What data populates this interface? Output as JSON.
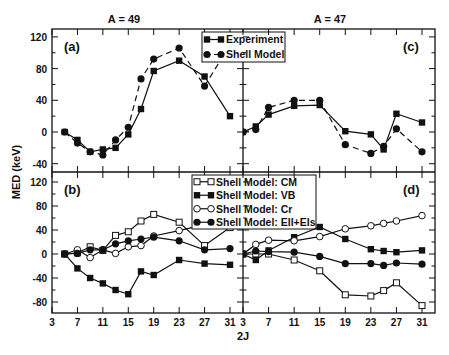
{
  "chart_data": {
    "type": "line",
    "ylabel": "MED (keV)",
    "xlabel": "2J",
    "x_ticks": [
      3,
      7,
      11,
      15,
      19,
      23,
      27,
      31
    ],
    "column_titles": [
      "A = 49",
      "A = 47"
    ],
    "panels": [
      {
        "id": "a",
        "label": "(a)",
        "column": 0,
        "row": 0,
        "ylim": [
          -48,
          130
        ],
        "y_ticks": [
          -40,
          0,
          40,
          80,
          120
        ],
        "legend": {
          "entries": [
            "Experiment",
            "Shell Model"
          ]
        },
        "series": [
          {
            "name": "Experiment",
            "marker": "square-filled",
            "dash": false,
            "x": [
              5,
              7,
              9,
              11,
              13,
              15,
              17,
              19,
              23,
              27,
              31
            ],
            "y": [
              0,
              -10,
              -25,
              -22,
              -20,
              -3,
              29,
              77,
              90,
              70,
              20
            ]
          },
          {
            "name": "Shell Model",
            "marker": "circle-filled",
            "dash": true,
            "x": [
              5,
              7,
              9,
              11,
              13,
              15,
              17,
              19,
              23,
              27,
              31
            ],
            "y": [
              0,
              -14,
              -25,
              -29,
              -10,
              6,
              67,
              92,
              106,
              58,
              110
            ]
          }
        ]
      },
      {
        "id": "c",
        "label": "(c)",
        "column": 1,
        "row": 0,
        "ylim": [
          -48,
          130
        ],
        "y_ticks": [
          -40,
          0,
          40,
          80,
          120
        ],
        "series": [
          {
            "name": "Experiment",
            "marker": "square-filled",
            "dash": false,
            "x": [
              3,
              5,
              7,
              11,
              15,
              19,
              23,
              25,
              27,
              31
            ],
            "y": [
              0,
              7,
              22,
              33,
              34,
              1,
              -3,
              -22,
              23,
              12
            ]
          },
          {
            "name": "Shell Model",
            "marker": "circle-filled",
            "dash": true,
            "x": [
              3,
              5,
              7,
              11,
              15,
              19,
              23,
              25,
              27,
              31
            ],
            "y": [
              0,
              3,
              31,
              40,
              40,
              -16,
              -27,
              -18,
              4,
              -25
            ]
          }
        ]
      },
      {
        "id": "b",
        "label": "(b)",
        "column": 0,
        "row": 1,
        "ylim": [
          -100,
          140
        ],
        "y_ticks": [
          -80,
          -40,
          0,
          40,
          80,
          120
        ],
        "legend": {
          "entries": [
            "Shell Model: CM",
            "Shell Model: VB",
            "Shell Model: Cr",
            "Shell Model: Ell+Els"
          ]
        },
        "series": [
          {
            "name": "Shell Model: CM",
            "marker": "square-open",
            "dash": false,
            "x": [
              5,
              7,
              9,
              11,
              13,
              15,
              17,
              19,
              23,
              27,
              31
            ],
            "y": [
              0,
              2,
              12,
              6,
              31,
              37,
              55,
              66,
              53,
              14,
              44
            ]
          },
          {
            "name": "Shell Model: VB",
            "marker": "square-filled",
            "dash": false,
            "x": [
              5,
              7,
              9,
              11,
              13,
              15,
              17,
              19,
              23,
              27,
              31
            ],
            "y": [
              0,
              -24,
              -40,
              -49,
              -60,
              -67,
              -29,
              -35,
              -10,
              -16,
              -18
            ]
          },
          {
            "name": "Shell Model: Cr",
            "marker": "circle-open",
            "dash": false,
            "x": [
              5,
              7,
              9,
              11,
              13,
              15,
              17,
              19,
              23,
              27
            ],
            "y": [
              0,
              7,
              -6,
              7,
              1,
              12,
              14,
              30,
              39,
              49
            ]
          },
          {
            "name": "Shell Model: Ell+Els",
            "marker": "circle-filled",
            "dash": false,
            "x": [
              5,
              7,
              9,
              11,
              13,
              15,
              17,
              19,
              23,
              27,
              31
            ],
            "y": [
              0,
              1,
              7,
              7,
              17,
              22,
              25,
              28,
              22,
              7,
              9
            ]
          }
        ]
      },
      {
        "id": "d",
        "label": "(d)",
        "column": 1,
        "row": 1,
        "ylim": [
          -100,
          140
        ],
        "y_ticks": [
          -80,
          -40,
          0,
          40,
          80,
          120
        ],
        "series": [
          {
            "name": "Shell Model: CM",
            "marker": "square-open",
            "dash": false,
            "x": [
              3,
              5,
              7,
              11,
              15,
              19,
              23,
              25,
              27,
              31
            ],
            "y": [
              0,
              0,
              0,
              -10,
              -28,
              -68,
              -70,
              -61,
              -48,
              -86
            ]
          },
          {
            "name": "Shell Model: VB",
            "marker": "square-filled",
            "dash": false,
            "x": [
              3,
              5,
              7,
              11,
              15,
              19,
              23,
              25,
              27,
              31
            ],
            "y": [
              0,
              -10,
              6,
              28,
              45,
              25,
              8,
              5,
              3,
              6
            ]
          },
          {
            "name": "Shell Model: Cr",
            "marker": "circle-open",
            "dash": false,
            "x": [
              3,
              5,
              7,
              11,
              15,
              19,
              23,
              25,
              27,
              31
            ],
            "y": [
              0,
              16,
              23,
              22,
              29,
              42,
              47,
              51,
              55,
              64
            ]
          },
          {
            "name": "Shell Model: Ell+Els",
            "marker": "circle-filled",
            "dash": false,
            "x": [
              3,
              5,
              7,
              11,
              15,
              19,
              23,
              25,
              27,
              31
            ],
            "y": [
              0,
              5,
              4,
              3,
              -4,
              -16,
              -16,
              -19,
              -15,
              -17
            ]
          }
        ]
      }
    ]
  },
  "colors": {
    "ink": "#111111",
    "background": "#ffffff"
  }
}
